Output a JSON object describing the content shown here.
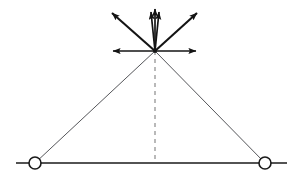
{
  "figure": {
    "type": "engineering-vector-diagram",
    "title": "",
    "canvas": {
      "width": 301,
      "height": 178
    },
    "colors": {
      "ground_line": "#1a1a1a",
      "truss_member": "#55565a",
      "centerline_dashed": "#a8a8a8",
      "vector_arrow": "#141414",
      "node_fill": "#ffffff",
      "node_stroke": "#1a1a1a",
      "background": "#ffffff"
    },
    "geometry": {
      "apex": {
        "x": 155,
        "y": 51
      },
      "ground_y": 163,
      "ground_x_start": 16,
      "ground_x_end": 287,
      "support_left": {
        "x": 35,
        "y": 163
      },
      "support_right": {
        "x": 265,
        "y": 163
      },
      "node_radius": 6
    },
    "supports": [
      {
        "name": "left-pin-support",
        "x": 35,
        "y": 163,
        "radius": 6,
        "style": "hollow-circle"
      },
      {
        "name": "right-pin-support",
        "x": 265,
        "y": 163,
        "radius": 6,
        "style": "hollow-circle"
      }
    ],
    "members": [
      {
        "name": "left-leg",
        "from": {
          "x": 35,
          "y": 163
        },
        "to": {
          "x": 155,
          "y": 51
        }
      },
      {
        "name": "right-leg",
        "from": {
          "x": 265,
          "y": 163
        },
        "to": {
          "x": 155,
          "y": 51
        }
      },
      {
        "name": "ground-line",
        "from": {
          "x": 16,
          "y": 163
        },
        "to": {
          "x": 287,
          "y": 163
        }
      }
    ],
    "centerline": {
      "name": "vertical-centerline",
      "from": {
        "x": 155,
        "y": 51
      },
      "to": {
        "x": 155,
        "y": 163
      },
      "dash": "4 4"
    },
    "vectors": [
      {
        "name": "vector-up-center-left",
        "label": "",
        "from": {
          "x": 155,
          "y": 51
        },
        "to": {
          "x": 151,
          "y": 12
        },
        "direction": "up"
      },
      {
        "name": "vector-up-center",
        "label": "",
        "from": {
          "x": 155,
          "y": 51
        },
        "to": {
          "x": 155,
          "y": 9
        },
        "direction": "up"
      },
      {
        "name": "vector-up-center-right",
        "label": "",
        "from": {
          "x": 155,
          "y": 51
        },
        "to": {
          "x": 159,
          "y": 12
        },
        "direction": "up"
      },
      {
        "name": "vector-up-left-diagonal",
        "label": "",
        "from": {
          "x": 155,
          "y": 51
        },
        "to": {
          "x": 112,
          "y": 13
        },
        "direction": "up-left"
      },
      {
        "name": "vector-up-right-diagonal",
        "label": "",
        "from": {
          "x": 155,
          "y": 51
        },
        "to": {
          "x": 197,
          "y": 13
        },
        "direction": "up-right"
      },
      {
        "name": "vector-horizontal-left",
        "label": "",
        "from": {
          "x": 155,
          "y": 51
        },
        "to": {
          "x": 113,
          "y": 51
        },
        "direction": "left"
      },
      {
        "name": "vector-horizontal-right",
        "label": "",
        "from": {
          "x": 155,
          "y": 51
        },
        "to": {
          "x": 196,
          "y": 51
        },
        "direction": "right"
      }
    ],
    "vector_count": 7,
    "annotations": []
  }
}
